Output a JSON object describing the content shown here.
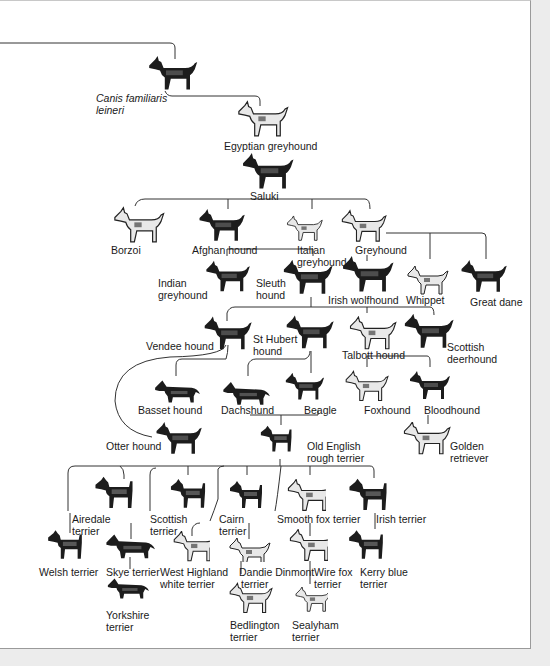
{
  "diagram": {
    "type": "family-tree",
    "colors": {
      "background": "#ffffff",
      "line": "#333333",
      "text": "#1a1a1a",
      "margin": "#ececec"
    },
    "nodes": [
      {
        "id": "canis",
        "label_line1": "Canis familiaris",
        "label_line2": "leineri",
        "italic": true
      },
      {
        "id": "egyptian",
        "label_line1": "Egyptian greyhound"
      },
      {
        "id": "saluki",
        "label_line1": "Saluki"
      },
      {
        "id": "borzoi",
        "label_line1": "Borzoi"
      },
      {
        "id": "afghan",
        "label_line1": "Afghan hound"
      },
      {
        "id": "italian",
        "label_line1": "Italian",
        "label_line2": "greyhound"
      },
      {
        "id": "greyhound",
        "label_line1": "Greyhound"
      },
      {
        "id": "indian",
        "label_line1": "Indian",
        "label_line2": "greyhound"
      },
      {
        "id": "sleuth",
        "label_line1": "Sleuth",
        "label_line2": "hound"
      },
      {
        "id": "irishwolf",
        "label_line1": "Irish wolfhound"
      },
      {
        "id": "whippet",
        "label_line1": "Whippet"
      },
      {
        "id": "greatdane",
        "label_line1": "Great dane"
      },
      {
        "id": "vendee",
        "label_line1": "Vendee hound"
      },
      {
        "id": "sthubert",
        "label_line1": "St Hubert",
        "label_line2": "hound"
      },
      {
        "id": "talbott",
        "label_line1": "Talbott hound"
      },
      {
        "id": "scotdeer",
        "label_line1": "Scottish",
        "label_line2": "deerhound"
      },
      {
        "id": "basset",
        "label_line1": "Basset hound"
      },
      {
        "id": "dachshund",
        "label_line1": "Dachshund"
      },
      {
        "id": "beagle",
        "label_line1": "Beagle"
      },
      {
        "id": "foxhound",
        "label_line1": "Foxhound"
      },
      {
        "id": "bloodhound",
        "label_line1": "Bloodhound"
      },
      {
        "id": "otter",
        "label_line1": "Otter hound"
      },
      {
        "id": "oldenglish",
        "label_line1": "Old English",
        "label_line2": "rough terrier"
      },
      {
        "id": "golden",
        "label_line1": "Golden",
        "label_line2": "retriever"
      },
      {
        "id": "airedale",
        "label_line1": "Airedale",
        "label_line2": "terrier"
      },
      {
        "id": "scottish",
        "label_line1": "Scottish",
        "label_line2": "terrier"
      },
      {
        "id": "cairn",
        "label_line1": "Cairn",
        "label_line2": "terrier"
      },
      {
        "id": "smoothfox",
        "label_line1": "Smooth fox terrier"
      },
      {
        "id": "irishterrier",
        "label_line1": "Irish terrier"
      },
      {
        "id": "welsh",
        "label_line1": "Welsh terrier"
      },
      {
        "id": "skye",
        "label_line1": "Skye terrier"
      },
      {
        "id": "westie",
        "label_line1": "West Highland",
        "label_line2": "white terrier"
      },
      {
        "id": "dandie",
        "label_line1": "Dandie Dinmont",
        "label_line2": "terrier"
      },
      {
        "id": "wirefox",
        "label_line1": "Wire fox",
        "label_line2": "terrier"
      },
      {
        "id": "kerry",
        "label_line1": "Kerry blue",
        "label_line2": "terrier"
      },
      {
        "id": "yorkshire",
        "label_line1": "Yorkshire",
        "label_line2": "terrier"
      },
      {
        "id": "bedlington",
        "label_line1": "Bedlington",
        "label_line2": "terrier"
      },
      {
        "id": "sealyham",
        "label_line1": "Sealyham",
        "label_line2": "terrier"
      }
    ]
  }
}
